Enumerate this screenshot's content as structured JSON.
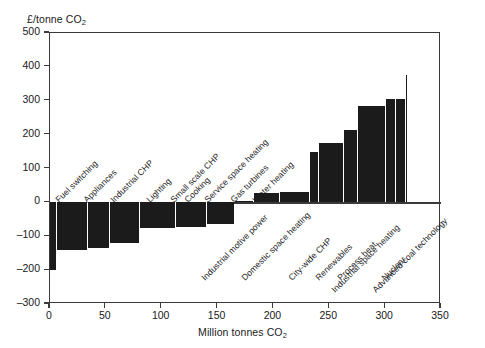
{
  "chart_data": {
    "type": "bar",
    "title": "",
    "subtitle": "",
    "ylabel": "£/tonne CO2",
    "ylabel_parts": {
      "prefix": "£/tonne CO",
      "sub": "2"
    },
    "xlabel": "Million tonnes CO2",
    "xlabel_parts": {
      "prefix": "Million tonnes CO",
      "sub": "2"
    },
    "xlim": [
      0,
      350
    ],
    "ylim": [
      -300,
      500
    ],
    "xticks": [
      0,
      50,
      100,
      150,
      200,
      250,
      300,
      350
    ],
    "yticks": [
      500,
      400,
      300,
      200,
      100,
      0,
      -100,
      -200,
      -300
    ],
    "xtick_labels": [
      "0",
      "50",
      "100",
      "150",
      "200",
      "250",
      "300",
      "350"
    ],
    "ytick_labels": [
      "500",
      "400",
      "300",
      "200",
      "100",
      "0",
      "-100",
      "-200",
      "-300"
    ],
    "grid": false,
    "legend": "none",
    "bar_color": "#1b1b1b",
    "axis_color": "#3a3a3a",
    "zero_line": 0,
    "note": "Marginal abatement cost curve: bar width = abatement potential (Mt CO2), bar height = cost (£/tonne CO2)",
    "bars": [
      {
        "label": "Fuel switching",
        "x_start": 0,
        "x_end": 5,
        "value": -200,
        "label_side": "above"
      },
      {
        "label": "Appliances",
        "x_start": 5,
        "x_end": 33,
        "value": -140,
        "label_side": "above"
      },
      {
        "label": "Industrial CHP",
        "x_start": 33,
        "x_end": 53,
        "value": -135,
        "label_side": "above"
      },
      {
        "label": "Lighting",
        "x_start": 53,
        "x_end": 80,
        "value": -120,
        "label_side": "above"
      },
      {
        "label": "Small scale CHP",
        "x_start": 80,
        "x_end": 112,
        "value": -75,
        "label_side": "above"
      },
      {
        "label": "Cooking",
        "x_start": 112,
        "x_end": 140,
        "value": -72,
        "label_side": "above"
      },
      {
        "label": "Service space heating",
        "x_start": 140,
        "x_end": 165,
        "value": -65,
        "label_side": "above"
      },
      {
        "label": "Gas turbines",
        "x_start": 165,
        "x_end": 182,
        "value": 5,
        "label_side": "above"
      },
      {
        "label": "Water heating",
        "x_start": 182,
        "x_end": 205,
        "value": 28,
        "label_side": "above"
      },
      {
        "label": "Industrial motive power",
        "x_start": 205,
        "x_end": 232,
        "value": 30,
        "label_side": "below"
      },
      {
        "label": "Domestic space heating",
        "x_start": 232,
        "x_end": 240,
        "value": 150,
        "label_side": "below"
      },
      {
        "label": "City-wide CHP",
        "x_start": 240,
        "x_end": 262,
        "value": 175,
        "label_side": "below"
      },
      {
        "label": "Renewables",
        "x_start": 262,
        "x_end": 275,
        "value": 215,
        "label_side": "below"
      },
      {
        "label": "Process heat",
        "x_start": 275,
        "x_end": 300,
        "value": 285,
        "label_side": "below"
      },
      {
        "label": "Industrial space heating",
        "x_start": 300,
        "x_end": 309,
        "value": 305,
        "label_side": "below"
      },
      {
        "label": "Nuclear",
        "x_start": 309,
        "x_end": 318,
        "value": 305,
        "label_side": "below"
      },
      {
        "label": "Advanced coal technology",
        "x_start": 318,
        "x_end": 320,
        "value": 375,
        "label_side": "below"
      }
    ],
    "label_anchors": [
      {
        "label": "Fuel switching",
        "lx": 57,
        "ly": 196
      },
      {
        "label": "Appliances",
        "lx": 85,
        "ly": 196
      },
      {
        "label": "Industrial CHP",
        "lx": 112,
        "ly": 196
      },
      {
        "label": "Lighting",
        "lx": 148,
        "ly": 196
      },
      {
        "label": "Small scale CHP",
        "lx": 172,
        "ly": 196
      },
      {
        "label": "Cooking",
        "lx": 186,
        "ly": 196
      },
      {
        "label": "Service space heating",
        "lx": 206,
        "ly": 196
      },
      {
        "label": "Gas turbines",
        "lx": 232,
        "ly": 196
      },
      {
        "label": "Water heating",
        "lx": 254,
        "ly": 196
      },
      {
        "label": "Industrial motive power",
        "lx": 203,
        "ly": 274
      },
      {
        "label": "Domestic space heating",
        "lx": 243,
        "ly": 274
      },
      {
        "label": "City-wide CHP",
        "lx": 290,
        "ly": 274
      },
      {
        "label": "Renewables",
        "lx": 317,
        "ly": 274
      },
      {
        "label": "Process heat",
        "lx": 339,
        "ly": 274
      },
      {
        "label": "Industrial space heating",
        "lx": 333,
        "ly": 286
      },
      {
        "label": "Nuclear",
        "lx": 383,
        "ly": 274
      },
      {
        "label": "Advanced coal technology",
        "lx": 374,
        "ly": 286
      }
    ]
  }
}
